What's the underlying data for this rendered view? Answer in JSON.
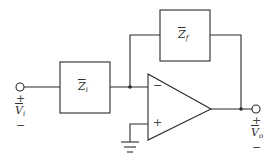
{
  "diagram": {
    "type": "inverting-op-amp-circuit",
    "components": {
      "input_impedance": {
        "symbol": "Z",
        "subscript": "i"
      },
      "feedback_impedance": {
        "symbol": "Z",
        "subscript": "f"
      },
      "op_amp": {
        "inverting_input_sign": "−",
        "noninverting_input_sign": "+"
      }
    },
    "input_voltage": {
      "symbol": "V",
      "subscript": "i",
      "plus": "+",
      "minus": "−"
    },
    "output_voltage": {
      "symbol": "V",
      "subscript": "o",
      "plus": "+",
      "minus": "−"
    },
    "colors": {
      "line": "#2b2b2b",
      "background": "#ffffff"
    }
  }
}
